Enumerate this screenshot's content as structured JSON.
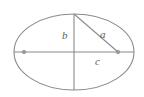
{
  "figure": {
    "type": "geometry-diagram",
    "background_color": "#ffffff",
    "stroke_color": "#8a8a8a",
    "label_color": "#5c5c5c",
    "canvas": {
      "width": 144,
      "height": 97
    },
    "ellipse": {
      "center_x": 74,
      "center_y": 52,
      "radius_x": 60,
      "radius_y": 38,
      "stroke_width": 1.1
    },
    "major_axis_line": {
      "name": "horizontal-major-axis",
      "x1": 14,
      "y1": 52,
      "x2": 134,
      "y2": 52
    },
    "minor_axis_line": {
      "name": "vertical-semi-minor-axis",
      "x1": 74,
      "y1": 14,
      "x2": 74,
      "y2": 90
    },
    "hypotenuse_line": {
      "name": "focus-to-covertex-segment",
      "x1": 74,
      "y1": 14,
      "x2": 118,
      "y2": 52
    },
    "foci": [
      {
        "name": "left-focus",
        "cx": 24,
        "cy": 52,
        "r": 1.8
      },
      {
        "name": "right-focus",
        "cx": 118,
        "cy": 52,
        "r": 1.8
      }
    ],
    "labels": {
      "b": "b",
      "a": "a",
      "c": "c"
    }
  }
}
